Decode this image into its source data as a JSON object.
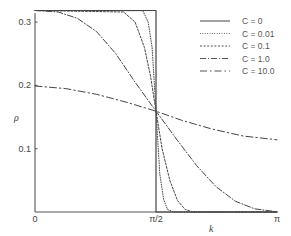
{
  "chart_data": {
    "type": "line",
    "title": "",
    "xlabel": "k",
    "ylabel": "ρ",
    "xlim": [
      0,
      3.14159
    ],
    "ylim": [
      0,
      0.3183
    ],
    "grid": false,
    "legend_position": "upper right",
    "x_ticks": [
      {
        "value": 0,
        "label": "0"
      },
      {
        "value": 1.5708,
        "label": "π/2"
      },
      {
        "value": 3.14159,
        "label": "π"
      }
    ],
    "y_ticks": [
      {
        "value": 0.1,
        "label": "0.1"
      },
      {
        "value": 0.2,
        "label": "0.2"
      },
      {
        "value": 0.3,
        "label": "0.3"
      }
    ],
    "series": [
      {
        "name": "C = 0",
        "style": "solid",
        "x": [
          0,
          1.5708,
          1.5708,
          1.5708,
          3.14159
        ],
        "y": [
          0.3183,
          0.3183,
          0.1592,
          0,
          0
        ]
      },
      {
        "name": "C = 0.01",
        "style": "dotted",
        "x": [
          0,
          1.4,
          1.47,
          1.52,
          1.5708,
          1.62,
          1.67,
          1.72,
          1.8,
          3.14159
        ],
        "y": [
          0.3183,
          0.318,
          0.3,
          0.26,
          0.1592,
          0.06,
          0.02,
          0.004,
          0,
          0
        ]
      },
      {
        "name": "C = 0.1",
        "style": "dashed-fine",
        "x": [
          0,
          1.15,
          1.3,
          1.42,
          1.5,
          1.5708,
          1.65,
          1.75,
          1.85,
          1.95,
          2.05,
          3.14159
        ],
        "y": [
          0.3183,
          0.316,
          0.3,
          0.26,
          0.215,
          0.1592,
          0.1,
          0.05,
          0.018,
          0.004,
          0,
          0
        ]
      },
      {
        "name": "C = 1.0",
        "style": "dash-dot",
        "x": [
          0,
          0.3,
          0.55,
          0.8,
          1.05,
          1.3,
          1.5708,
          1.85,
          2.1,
          2.35,
          2.6,
          2.85,
          3.14159
        ],
        "y": [
          0.3183,
          0.316,
          0.306,
          0.285,
          0.25,
          0.205,
          0.1592,
          0.113,
          0.073,
          0.04,
          0.017,
          0.005,
          0.0003
        ]
      },
      {
        "name": "C = 10.0",
        "style": "long-dash-dot",
        "x": [
          0,
          0.4,
          0.8,
          1.2,
          1.5708,
          1.9,
          2.3,
          2.7,
          3.14159
        ],
        "y": [
          0.199,
          0.195,
          0.186,
          0.173,
          0.1592,
          0.145,
          0.131,
          0.12,
          0.114
        ]
      }
    ]
  },
  "axes": {
    "x_title": "k",
    "y_title": "ρ"
  },
  "legend": {
    "items": [
      {
        "label": "C = 0"
      },
      {
        "label": "C = 0.01"
      },
      {
        "label": "C = 0.1"
      },
      {
        "label": "C = 1.0"
      },
      {
        "label": "C = 10.0"
      }
    ]
  }
}
